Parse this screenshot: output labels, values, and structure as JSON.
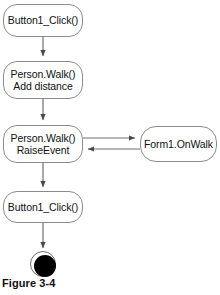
{
  "figure": {
    "caption": "Figure 3-4",
    "type": "uml-activity-diagram"
  },
  "nodes": [
    {
      "id": "button1-click-top",
      "shape": "rounded-rectangle",
      "lines": [
        "Button1_Click()"
      ]
    },
    {
      "id": "person-walk-add",
      "shape": "rounded-rectangle",
      "lines": [
        "Person.Walk()",
        "Add distance"
      ]
    },
    {
      "id": "person-walk-raise",
      "shape": "rounded-rectangle",
      "lines": [
        "Person.Walk()",
        "RaiseEvent"
      ]
    },
    {
      "id": "form1-onwalk",
      "shape": "rounded-rectangle",
      "lines": [
        "Form1.OnWalk"
      ]
    },
    {
      "id": "button1-click-bottom",
      "shape": "rounded-rectangle",
      "lines": [
        "Button1_Click()"
      ]
    },
    {
      "id": "final-state",
      "shape": "filled-circle-with-ring",
      "lines": []
    }
  ],
  "edges": [
    {
      "id": "e1",
      "from": "button1-click-top",
      "to": "person-walk-add",
      "direction": "down",
      "label": ""
    },
    {
      "id": "e2",
      "from": "person-walk-add",
      "to": "person-walk-raise",
      "direction": "down",
      "label": ""
    },
    {
      "id": "e3",
      "from": "person-walk-raise",
      "to": "form1-onwalk",
      "direction": "right",
      "label": ""
    },
    {
      "id": "e4",
      "from": "form1-onwalk",
      "to": "person-walk-raise",
      "direction": "left",
      "label": ""
    },
    {
      "id": "e5",
      "from": "person-walk-raise",
      "to": "button1-click-bottom",
      "direction": "down",
      "label": ""
    },
    {
      "id": "e6",
      "from": "button1-click-bottom",
      "to": "final-state",
      "direction": "down",
      "label": ""
    }
  ],
  "colors": {
    "background": "#ffffff",
    "node_border": "#8c8c8c",
    "node_fill": "#ffffff",
    "edge": "#6e6e6e",
    "text": "#111111",
    "final_state_fill": "#000000"
  }
}
